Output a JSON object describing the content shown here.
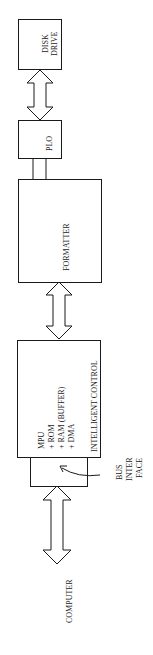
{
  "diagram": {
    "orientation": "rotated -90deg (reads bottom-to-top)",
    "blocks": [
      {
        "id": "disk_drive",
        "label_line1": "DISK",
        "label_line2": "DRIVE"
      },
      {
        "id": "plo",
        "label": "PLO"
      },
      {
        "id": "formatter",
        "label": "FORMATTER"
      },
      {
        "id": "intelligent_control",
        "lines": [
          "MPU",
          "+ ROM",
          "+ RAM (BUFFER)",
          "+ DMA"
        ],
        "title": "INTELLIGENT CONTROL"
      },
      {
        "id": "bus_interface",
        "label_line1": "BUS",
        "label_line2": "INTER",
        "label_line3": "FACE"
      }
    ],
    "endpoint": {
      "label": "COMPUTER"
    },
    "connections": [
      {
        "from": "disk_drive",
        "to": "plo",
        "type": "double-arrow"
      },
      {
        "from": "plo",
        "to": "formatter",
        "type": "parallel-lines"
      },
      {
        "from": "formatter",
        "to": "intelligent_control",
        "type": "double-arrow"
      },
      {
        "from": "bus_interface",
        "to": "computer",
        "type": "double-arrow"
      }
    ]
  }
}
